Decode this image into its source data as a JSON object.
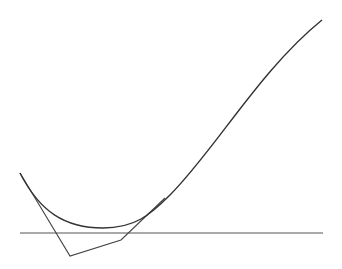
{
  "diagram": {
    "width": 342,
    "height": 269,
    "background": "#ffffff",
    "baseline": {
      "x1": 20,
      "y1": 233,
      "x2": 323,
      "y2": 233,
      "color": "#555555",
      "stroke_width": 1.2
    },
    "control_polygon": {
      "points": [
        [
          20,
          173
        ],
        [
          70,
          256
        ],
        [
          121,
          240
        ],
        [
          165,
          198
        ]
      ],
      "color": "#444444",
      "stroke_width": 1.1
    },
    "curve": {
      "path": "M20,173 C40,212 65,228 103,228 C135,228 150,215 170,195 C215,150 260,70 322,20",
      "color": "#333333",
      "stroke_width": 1.4
    }
  }
}
